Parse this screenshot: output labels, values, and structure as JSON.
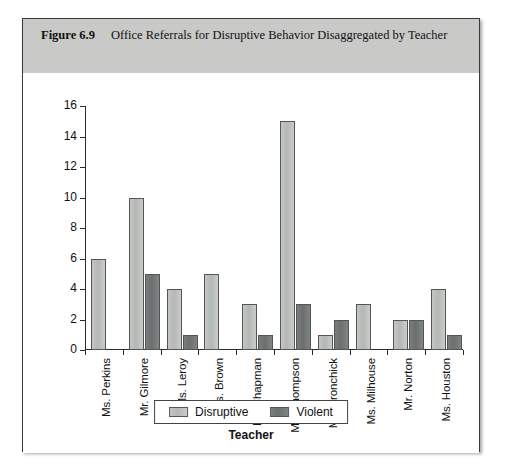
{
  "figure": {
    "number": "Figure 6.9",
    "caption": "Office Referrals for Disruptive Behavior Disaggregated by Teacher"
  },
  "colors": {
    "header_background": "#c9c9c7",
    "frame_border": "#3a3a3a",
    "disruptive": "#b8bcb8",
    "violent": "#6e7272",
    "axis": "#2b2b2b",
    "text": "#111111"
  },
  "chart_data": {
    "type": "bar",
    "title": "Office Referrals for Disruptive Behavior Disaggregated by Teacher",
    "xlabel": "Teacher",
    "ylabel": "",
    "ylim": [
      0,
      16
    ],
    "yticks": [
      0,
      2,
      4,
      6,
      8,
      10,
      12,
      14,
      16
    ],
    "grid": false,
    "legend_position": "bottom",
    "categories": [
      "Ms. Perkins",
      "Mr. Gilmore",
      "Ms. Leroy",
      "Ms. Brown",
      "Mr. Chapman",
      "Ms. Thompson",
      "Ms. Aronchick",
      "Ms. Milhouse",
      "Mr. Norton",
      "Ms. Houston"
    ],
    "series": [
      {
        "name": "Disruptive",
        "color": "#b8bcb8",
        "values": [
          6,
          10,
          4,
          5,
          3,
          15,
          1,
          3,
          2,
          4
        ]
      },
      {
        "name": "Violent",
        "color": "#6e7272",
        "values": [
          0,
          5,
          1,
          0,
          1,
          3,
          2,
          0,
          2,
          1
        ]
      }
    ]
  }
}
